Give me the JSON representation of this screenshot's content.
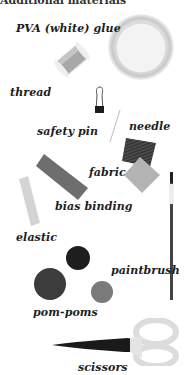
{
  "heading": "Additional materials",
  "labels": {
    "glue": "PVA (white) glue",
    "thread": "thread",
    "safety_pin": "safety pin",
    "needle": "needle",
    "fabric": "fabric",
    "bias_binding": "bias binding",
    "elastic": "elastic",
    "paintbrush": "paintbrush",
    "pom_poms": "pom-poms",
    "scissors": "scissors"
  },
  "colors": {
    "label_text": "#1d1d1d",
    "glue_pot": "#e8e8e8",
    "fabric_dark": "#4a4a4a",
    "fabric_light": "#b4b4b4",
    "bias_binding": "#6e6e6e",
    "pom_dark": "#1e1e1e",
    "pom_mid": "#3c3c3c",
    "pom_light": "#7a7a7a",
    "scissors_blade": "#1a1a1a",
    "scissors_handle": "#e0e0e0"
  }
}
